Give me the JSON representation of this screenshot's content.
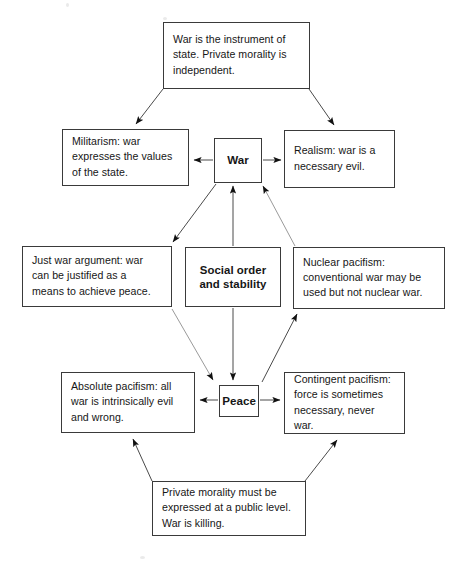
{
  "diagram": {
    "stroke_color": "#3a3a3a",
    "text_color": "#161616",
    "background_color": "#ffffff",
    "nodes": {
      "top_premise": "War is the instrument of\nstate. Private morality is\nindependent.",
      "militarism": "Militarism: war\nexpresses the values\nof the state.",
      "war": "War",
      "realism": "Realism: war is a\nnecessary evil.",
      "just_war": "Just war argument: war\ncan be justified as a\nmeans to achieve peace.",
      "social_order": "Social order\nand stability",
      "nuclear_pacifism": "Nuclear pacifism:\nconventional war may be\nused but not nuclear war.",
      "absolute_pacifism": "Absolute pacifism: all\nwar is intrinsically evil\nand wrong.",
      "peace": "Peace",
      "contingent_pacifism": "Contingent pacifism:\nforce is sometimes\nnecessary, never war.",
      "bottom_premise": "Private morality must be\nexpressed at a public level.\nWar is killing."
    },
    "edges": [
      {
        "from": "top_premise",
        "to": "militarism",
        "style": "arrow"
      },
      {
        "from": "top_premise",
        "to": "realism",
        "style": "arrow"
      },
      {
        "from": "war",
        "to": "militarism",
        "style": "arrow"
      },
      {
        "from": "war",
        "to": "realism",
        "style": "arrow"
      },
      {
        "from": "war",
        "to": "just_war",
        "style": "arrow"
      },
      {
        "from": "social_order",
        "to": "war",
        "style": "arrow"
      },
      {
        "from": "nuclear_pacifism",
        "to": "war",
        "style": "arrow"
      },
      {
        "from": "just_war",
        "to": "peace",
        "style": "arrow"
      },
      {
        "from": "social_order",
        "to": "peace",
        "style": "arrow"
      },
      {
        "from": "peace",
        "to": "nuclear_pacifism",
        "style": "arrow"
      },
      {
        "from": "peace",
        "to": "absolute_pacifism",
        "style": "arrow"
      },
      {
        "from": "peace",
        "to": "contingent_pacifism",
        "style": "arrow"
      },
      {
        "from": "bottom_premise",
        "to": "absolute_pacifism",
        "style": "arrow"
      },
      {
        "from": "bottom_premise",
        "to": "contingent_pacifism",
        "style": "arrow"
      }
    ]
  }
}
